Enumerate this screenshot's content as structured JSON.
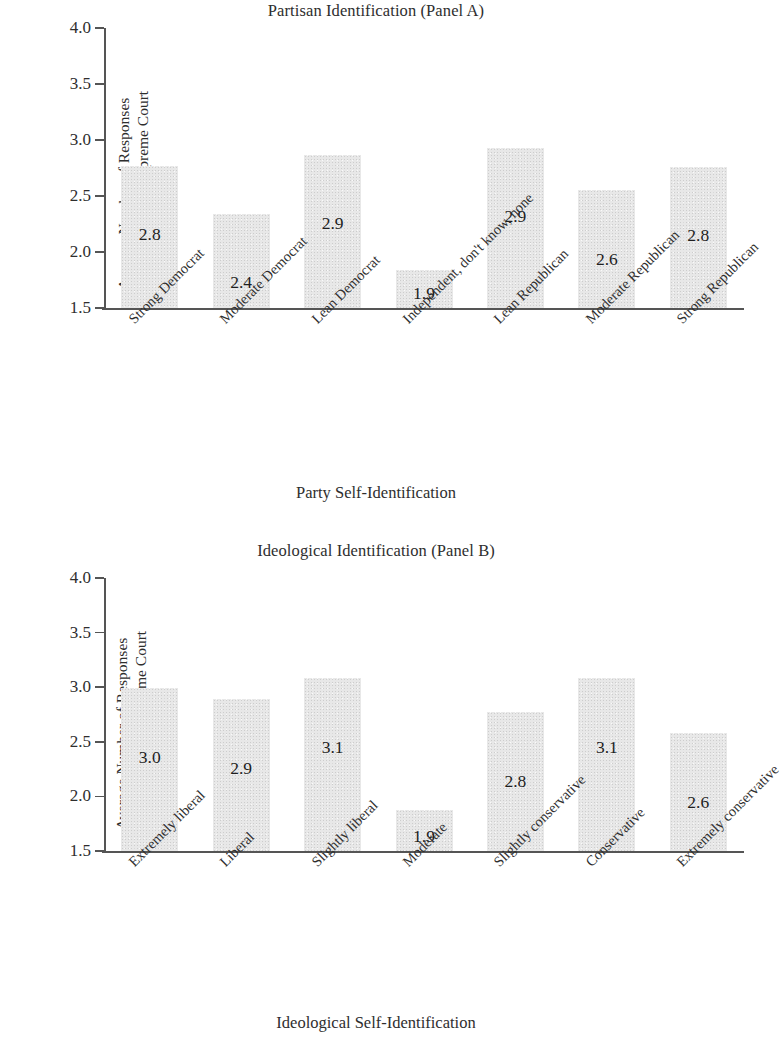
{
  "figure": {
    "background": "#ffffff",
    "bar_fill": "#e8e8e8",
    "axis_color": "#555555",
    "text_color": "#2e2e2e"
  },
  "chart_data": [
    {
      "type": "bar",
      "title": "Partisan Identification (Panel A)",
      "xlabel": "Party Self-Identification",
      "ylabel": "Average Number of Responses Supportive of the Supreme Court",
      "ylabel_line1": "Average Number of Responses",
      "ylabel_line2": "Supportive of the Supreme Court",
      "ylim": [
        1.5,
        4.0
      ],
      "yticks": [
        "1.5",
        "2.0",
        "2.5",
        "3.0",
        "3.5",
        "4.0"
      ],
      "ytick_values": [
        1.5,
        2.0,
        2.5,
        3.0,
        3.5,
        4.0
      ],
      "grid": false,
      "legend": "none",
      "categories": [
        "Strong Democrat",
        "Moderate Democrat",
        "Lean Democrat",
        "Independent, don't know, none",
        "Lean Republican",
        "Moderate Republican",
        "Strong Republican"
      ],
      "values": [
        2.8,
        2.4,
        2.9,
        1.9,
        2.9,
        2.6,
        2.8
      ],
      "data_labels": [
        "2.8",
        "2.4",
        "2.9",
        "1.9",
        "2.9",
        "2.6",
        "2.8"
      ],
      "drawn_bar_tops": [
        2.77,
        2.34,
        2.87,
        1.84,
        2.93,
        2.55,
        2.76
      ]
    },
    {
      "type": "bar",
      "title": "Ideological Identification (Panel B)",
      "xlabel": "Ideological Self-Identification",
      "ylabel": "Average Number of Responses Supportive of the Supreme Court",
      "ylabel_line1": "Average Number of Responses",
      "ylabel_line2": "Supportive of the Supreme Court",
      "ylim": [
        1.5,
        4.0
      ],
      "yticks": [
        "1.5",
        "2.0",
        "2.5",
        "3.0",
        "3.5",
        "4.0"
      ],
      "ytick_values": [
        1.5,
        2.0,
        2.5,
        3.0,
        3.5,
        4.0
      ],
      "grid": false,
      "legend": "none",
      "categories": [
        "Extremely liberal",
        "Liberal",
        "Slightly liberal",
        "Moderate",
        "Slightly conservative",
        "Conservative",
        "Extremely conservative"
      ],
      "values": [
        3.0,
        2.9,
        3.1,
        1.9,
        2.8,
        3.1,
        2.6
      ],
      "data_labels": [
        "3.0",
        "2.9",
        "3.1",
        "1.9",
        "2.8",
        "3.1",
        "2.6"
      ],
      "drawn_bar_tops": [
        2.99,
        2.89,
        3.08,
        1.88,
        2.77,
        3.08,
        2.58
      ]
    }
  ]
}
